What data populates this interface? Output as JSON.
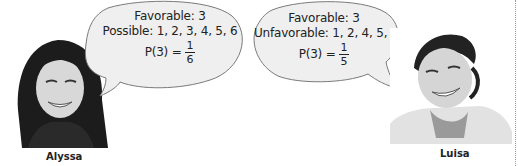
{
  "speakers": [
    {
      "name": "Alyssa",
      "bubble": {
        "line1": "Favorable: 3",
        "line2": "Possible: 1, 2, 3, 4, 5, 6",
        "prob_label": "P(3) =",
        "numerator": "1",
        "denominator": "6"
      }
    },
    {
      "name": "Luisa",
      "bubble": {
        "line1": "Favorable: 3",
        "line2": "Unfavorable: 1, 2, 4, 5, 6",
        "prob_label": "P(3) =",
        "numerator": "1",
        "denominator": "5"
      }
    }
  ],
  "colors": {
    "bubble_fill": "#efefef",
    "bubble_stroke": "#7a7a7a",
    "text": "#222222",
    "divider": "#9a9a9a"
  }
}
